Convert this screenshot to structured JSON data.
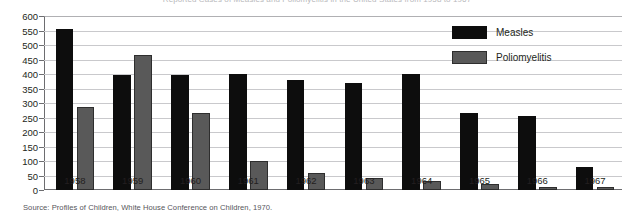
{
  "chart_data": {
    "type": "bar",
    "title": "Reported Cases of Measles and Poliomyelitis in the United States from 1958 to 1967",
    "xlabel": "",
    "ylabel": "",
    "ylim": [
      0,
      600
    ],
    "ytick_step": 50,
    "grid": true,
    "legend_position": "top-right",
    "categories": [
      "1958",
      "1959",
      "1960",
      "1961",
      "1962",
      "1963",
      "1964",
      "1965",
      "1966",
      "1967"
    ],
    "series": [
      {
        "name": "Measles",
        "color": "#0d0d0d",
        "values": [
          555,
          395,
          395,
          400,
          380,
          370,
          400,
          265,
          255,
          80
        ]
      },
      {
        "name": "Poliomyelitis",
        "color": "#595959",
        "values": [
          285,
          465,
          265,
          100,
          60,
          40,
          30,
          20,
          12,
          10
        ]
      }
    ],
    "yticks": [
      "0",
      "50",
      "100",
      "150",
      "200",
      "250",
      "300",
      "350",
      "400",
      "450",
      "500",
      "550",
      "600"
    ],
    "source": "Source:  Profiles of Children, White House Conference on Children, 1970."
  }
}
